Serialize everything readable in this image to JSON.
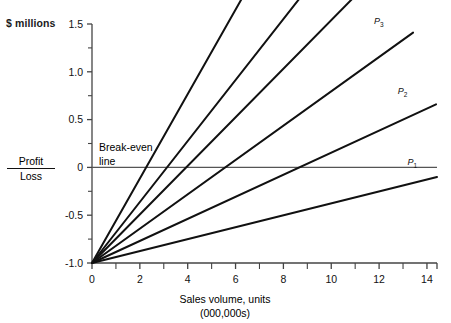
{
  "chart_data": {
    "type": "line",
    "title": "",
    "subtitle": "",
    "ylabel": "$ millions",
    "xlabel": "Sales volume, units",
    "xlabel_sub": "(000,000s)",
    "axis_label_profit": "Profit",
    "axis_label_loss": "Loss",
    "annotation_breakeven_line1": "Break-even",
    "annotation_breakeven_line2": "line",
    "xlim": [
      0,
      14.42
    ],
    "ylim": [
      -1.0,
      1.5
    ],
    "grid": false,
    "legend_position": "inline-end-labels",
    "x_major_step": 2,
    "x_minor_step": 1,
    "y_major_step": 0.5,
    "y_minor_step": 0.25,
    "xticks": [
      0,
      2,
      4,
      6,
      8,
      10,
      12,
      14
    ],
    "xtick_labels": [
      "0",
      "2",
      "4",
      "6",
      "8",
      "10",
      "12",
      "14"
    ],
    "yticks": [
      -1.0,
      -0.5,
      0,
      0.5,
      1.0,
      1.5
    ],
    "ytick_labels": [
      "-1.0",
      "-0.5",
      "0",
      "0.5",
      "1.0",
      "1.5"
    ],
    "y_minor_ticks": [
      -0.75,
      -0.25,
      0.25,
      0.75,
      1.25
    ],
    "fixed_cost": -1.0,
    "breakeven_value": 0,
    "common_origin": {
      "x": 0,
      "y": -1.0
    },
    "series": [
      {
        "name": "P1",
        "label": "P",
        "sub": "1",
        "x": [
          0,
          14.42
        ],
        "y": [
          -1.0,
          -0.1
        ],
        "breakeven_x": 10.2,
        "end_x": 14.42,
        "end_y": -0.1,
        "label_x": 13.35,
        "label_y": 0.04
      },
      {
        "name": "P2",
        "label": "P",
        "sub": "2",
        "x": [
          0,
          14.38
        ],
        "y": [
          -1.0,
          0.66
        ],
        "breakeven_x": 8.3,
        "end_x": 14.38,
        "end_y": 0.66,
        "label_x": 12.95,
        "label_y": 0.78
      },
      {
        "name": "P3",
        "label": "P",
        "sub": "3",
        "x": [
          0,
          13.42
        ],
        "y": [
          -1.0,
          1.41
        ],
        "breakeven_x": 6.8,
        "end_x": 13.42,
        "end_y": 1.41,
        "label_x": 11.95,
        "label_y": 1.51
      },
      {
        "name": "P4",
        "label": "P",
        "sub": "4",
        "x": [
          0,
          11.85
        ],
        "y": [
          -1.0,
          2.01
        ],
        "breakeven_x": 5.6,
        "end_x": 11.85,
        "end_y": 2.01,
        "label_x": 10.45,
        "label_y": 2.12
      },
      {
        "name": "P5",
        "label": "P",
        "sub": "5",
        "x": [
          0,
          10.22
        ],
        "y": [
          -1.0,
          2.26
        ],
        "breakeven_x": 4.3,
        "end_x": 10.22,
        "end_y": 2.26,
        "label_x": 8.82,
        "label_y": 2.36
      },
      {
        "name": "P6",
        "label": "P",
        "sub": "6",
        "x": [
          0,
          7.38
        ],
        "y": [
          -1.0,
          2.26
        ],
        "breakeven_x": 3.2,
        "end_x": 7.38,
        "end_y": 2.26,
        "label_x": 6.1,
        "label_y": 2.36
      }
    ],
    "colors": {
      "line": "#111111",
      "axis": "#444444",
      "breakeven": "#555555",
      "text": "#111111"
    }
  }
}
